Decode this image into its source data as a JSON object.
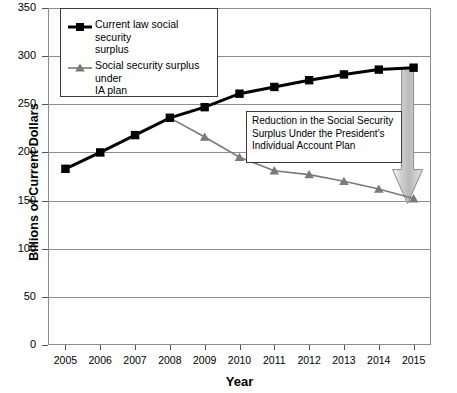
{
  "chart_data": {
    "type": "line",
    "title": "",
    "xlabel": "Year",
    "ylabel": "Billions of Current Dollars",
    "categories": [
      "2005",
      "2006",
      "2007",
      "2008",
      "2009",
      "2010",
      "2011",
      "2012",
      "2013",
      "2014",
      "2015"
    ],
    "ylim": [
      0,
      350
    ],
    "ytick_values": [
      "350",
      "300",
      "250",
      "200",
      "150",
      "100",
      "50",
      "0"
    ],
    "grid": true,
    "legend_position": "top-left",
    "series": [
      {
        "name": "Current law social security surplus",
        "marker": "square",
        "color": "#000000",
        "values": [
          183,
          200,
          218,
          236,
          247,
          261,
          268,
          275,
          281,
          286,
          288
        ]
      },
      {
        "name": "Social security surplus under IA plan",
        "marker": "triangle",
        "color": "#7a7a7a",
        "values": [
          183,
          200,
          218,
          236,
          216,
          195,
          181,
          177,
          170,
          162,
          152
        ]
      }
    ],
    "annotations": [
      {
        "name": "reduction-callout",
        "text": "Reduction in the Social Security Surplus Under the President's Individual Account Plan",
        "line1": "Reduction in the Social Security",
        "line2": "Surplus Under the President's",
        "line3": "Individual Account Plan"
      },
      {
        "name": "reduction-arrow",
        "shape": "down-arrow",
        "at_year": "2015",
        "from_value": 288,
        "to_value": 152,
        "color": "#c9c9c9"
      }
    ]
  },
  "legend": {
    "items": [
      {
        "label_line1": "Current law social security",
        "label_line2": "surplus"
      },
      {
        "label_line1": "Social security surplus under",
        "label_line2": "IA plan"
      }
    ]
  }
}
